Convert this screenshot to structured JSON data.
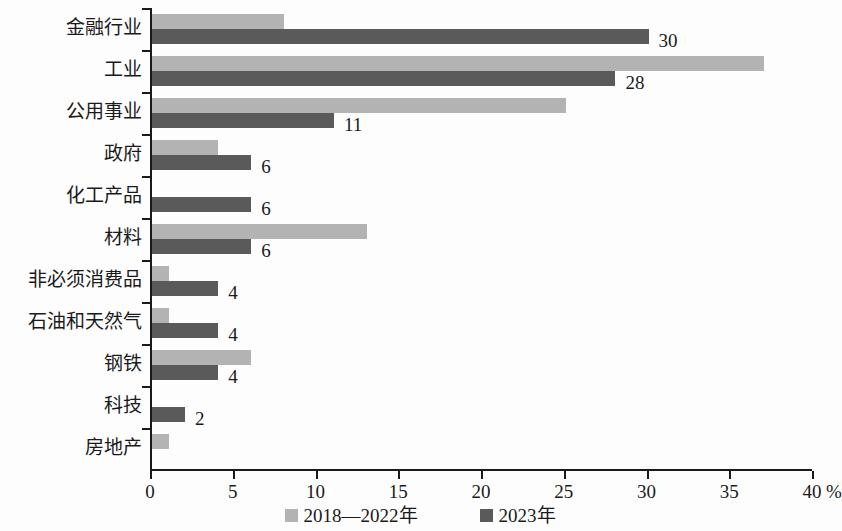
{
  "chart_data": {
    "type": "bar",
    "orientation": "horizontal",
    "title": "",
    "subtitle": "",
    "xlabel": "%",
    "ylabel": "",
    "xlim": [
      0,
      40
    ],
    "xticks": [
      0,
      5,
      10,
      15,
      20,
      25,
      30,
      35,
      40
    ],
    "xtick_labels": [
      "0",
      "5",
      "10",
      "15",
      "20",
      "25",
      "30",
      "35",
      "40"
    ],
    "axis_unit": "%",
    "grid": false,
    "legend_position": "bottom",
    "categories": [
      "金融行业",
      "工业",
      "公用事业",
      "政府",
      "化工产品",
      "材料",
      "非必须消费品",
      "石油和天然气",
      "钢铁",
      "科技",
      "房地产"
    ],
    "series": [
      {
        "name": "2018—2022年",
        "color": "#b3b3b3",
        "values": [
          8,
          37,
          25,
          4,
          0,
          13,
          1,
          1,
          6,
          0,
          1
        ]
      },
      {
        "name": "2023年",
        "color": "#5a5a5a",
        "values": [
          30,
          28,
          11,
          6,
          6,
          6,
          4,
          4,
          4,
          2,
          0
        ],
        "labels": [
          "30",
          "28",
          "11",
          "6",
          "6",
          "6",
          "4",
          "4",
          "4",
          "2",
          ""
        ]
      }
    ]
  },
  "legend": {
    "items": [
      {
        "label": "2018—2022年",
        "color": "#b3b3b3"
      },
      {
        "label": "2023年",
        "color": "#5a5a5a"
      }
    ]
  }
}
